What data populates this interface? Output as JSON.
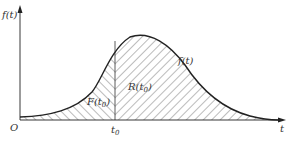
{
  "diagram": {
    "y_axis_label": "f(t)",
    "x_axis_label": "t",
    "origin_label": "O",
    "marker_label": "t",
    "marker_subscript": "0",
    "curve_label": "f(t)",
    "left_area_label": "F(t",
    "left_area_subscript": "0",
    "left_area_close": ")",
    "right_area_label": "R(t",
    "right_area_subscript": "0",
    "right_area_close": ")",
    "colors": {
      "line": "#222222",
      "hatch": "#555555",
      "text": "#333333"
    }
  }
}
